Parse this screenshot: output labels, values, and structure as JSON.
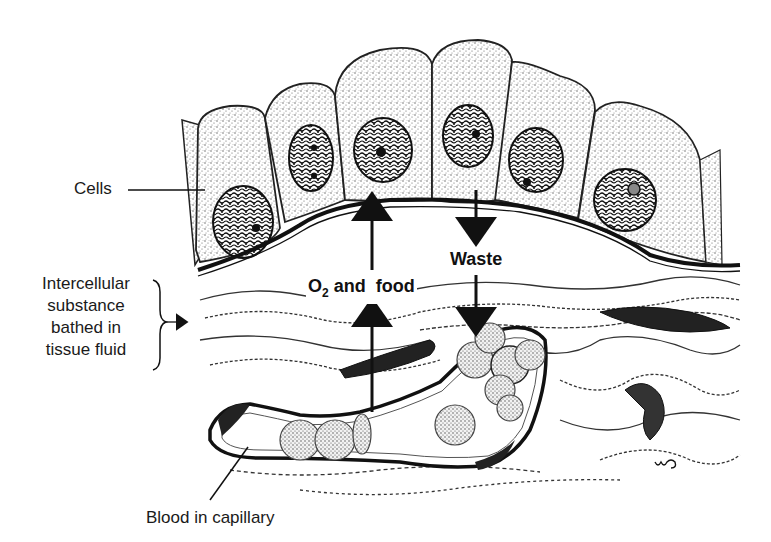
{
  "diagram": {
    "type": "biological-illustration",
    "labels": {
      "cells": "Cells",
      "intercellular": [
        "Intercellular",
        "substance",
        "bathed in",
        "tissue fluid"
      ],
      "blood": "Blood in capillary",
      "o2_prefix": "O",
      "o2_subscript": "2",
      "o2_suffix": " and  food",
      "waste": "Waste",
      "signature": "wo"
    },
    "arrows": [
      {
        "name": "o2-food-arrow",
        "direction": "up",
        "from": "capillary",
        "to": "cells"
      },
      {
        "name": "waste-arrow",
        "direction": "down",
        "from": "cells",
        "to": "capillary"
      }
    ],
    "cell_count": 6,
    "colors": {
      "ink": "#111111",
      "stipple": "#8a8a8a",
      "background": "#ffffff"
    }
  }
}
